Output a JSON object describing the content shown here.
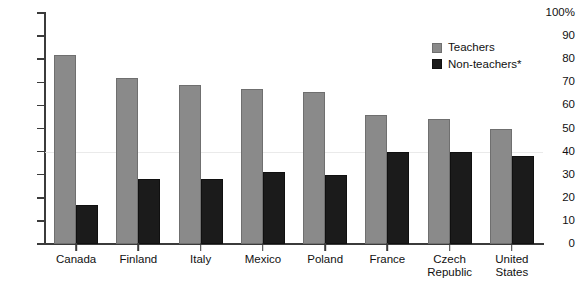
{
  "chart_data": {
    "type": "bar",
    "title": "",
    "xlabel": "",
    "ylabel": "",
    "ylim": [
      0,
      100
    ],
    "yticks": [
      0,
      10,
      20,
      30,
      40,
      50,
      60,
      70,
      80,
      90,
      100
    ],
    "ytick_labels": [
      "0",
      "10",
      "20",
      "30",
      "40",
      "50",
      "60",
      "70",
      "80",
      "90",
      "100%"
    ],
    "grid": "single faint horizontal line at 40",
    "legend_position": "top-right",
    "categories": [
      "Canada",
      "Finland",
      "Italy",
      "Mexico",
      "Poland",
      "France",
      "Czech Republic",
      "United States"
    ],
    "series": [
      {
        "name": "Teachers",
        "color": "#8a8a8a",
        "values": [
          82,
          72,
          69,
          67,
          66,
          56,
          54,
          50
        ]
      },
      {
        "name": "Non-teachers*",
        "color": "#1b1b1b",
        "values": [
          17,
          28,
          28,
          31,
          30,
          40,
          40,
          38
        ]
      }
    ]
  },
  "axis": {
    "tick_labels": [
      "100%",
      "90",
      "80",
      "70",
      "60",
      "50",
      "40",
      "30",
      "20",
      "10",
      "0"
    ],
    "tick_values": [
      100,
      90,
      80,
      70,
      60,
      50,
      40,
      30,
      20,
      10,
      0
    ]
  },
  "legend": {
    "items": [
      {
        "label": "Teachers",
        "color": "#8a8a8a"
      },
      {
        "label": "Non-teachers*",
        "color": "#1b1b1b"
      }
    ]
  },
  "categories": [
    {
      "label": "Canada"
    },
    {
      "label": "Finland"
    },
    {
      "label": "Italy"
    },
    {
      "label": "Mexico"
    },
    {
      "label": "Poland"
    },
    {
      "label": "France"
    },
    {
      "label": "Czech\nRepublic"
    },
    {
      "label": "United\nStates"
    }
  ]
}
